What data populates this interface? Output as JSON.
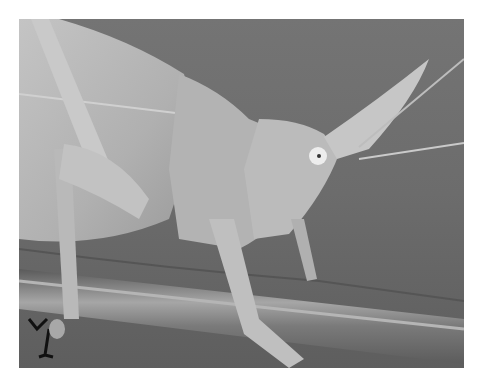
{
  "image": {
    "subject": "katydid on plant stem",
    "alt": "Close-up grayscale photograph of a cone-headed katydid perched on a plant stem",
    "colors": {
      "background": "#ffffff",
      "backdrop": "#6f6f6f",
      "insect_body": "#b8b8b8",
      "insect_highlight": "#d6d6d6",
      "stem": "#7e7e7e",
      "stem_highlight": "#a9a9a9",
      "eye": "#ededed"
    }
  }
}
